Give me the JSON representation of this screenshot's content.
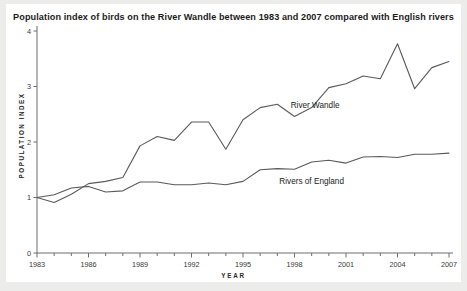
{
  "chart_data": {
    "type": "line",
    "title": "Population index of birds on the River Wandle between 1983 and 2007 compared with English rivers",
    "xlabel": "YEAR",
    "ylabel": "POPULATION INDEX",
    "xlim": [
      1983,
      2007
    ],
    "ylim": [
      0,
      4
    ],
    "yticks": [
      0,
      1,
      2,
      3,
      4
    ],
    "ytick_labels": [
      "0",
      "1",
      "2",
      "3",
      "4"
    ],
    "xticks": [
      1983,
      1984,
      1985,
      1986,
      1987,
      1988,
      1989,
      1990,
      1991,
      1992,
      1993,
      1994,
      1995,
      1996,
      1997,
      1998,
      1999,
      2000,
      2001,
      2002,
      2003,
      2004,
      2005,
      2006,
      2007
    ],
    "xtick_labels": [
      "1983",
      "1986",
      "1989",
      "1992",
      "1995",
      "1998",
      "2001",
      "2004",
      "2007"
    ],
    "labelled_xticks": [
      1983,
      1986,
      1989,
      1992,
      1995,
      1998,
      2001,
      2004,
      2007
    ],
    "grid": false,
    "legend_position": "inline-annotation",
    "x": [
      1983,
      1984,
      1985,
      1986,
      1987,
      1988,
      1989,
      1990,
      1991,
      1992,
      1993,
      1994,
      1995,
      1996,
      1997,
      1998,
      1999,
      2000,
      2001,
      2002,
      2003,
      2004,
      2005,
      2006,
      2007
    ],
    "series": [
      {
        "name": "River Wandle",
        "color": "#5a5a5a",
        "label_x": 1999.2,
        "label_y": 2.62,
        "values": [
          1.0,
          0.91,
          1.06,
          1.25,
          1.29,
          1.36,
          1.93,
          2.1,
          2.03,
          2.36,
          2.36,
          1.87,
          2.4,
          2.62,
          2.68,
          2.46,
          2.62,
          2.98,
          3.05,
          3.19,
          3.14,
          3.77,
          2.96,
          3.34,
          3.45
        ]
      },
      {
        "name": "Rivers of England",
        "color": "#5a5a5a",
        "label_x": 1999.0,
        "label_y": 1.25,
        "values": [
          1.0,
          1.05,
          1.17,
          1.2,
          1.1,
          1.12,
          1.28,
          1.28,
          1.23,
          1.23,
          1.26,
          1.23,
          1.29,
          1.5,
          1.52,
          1.51,
          1.64,
          1.67,
          1.62,
          1.73,
          1.74,
          1.72,
          1.78,
          1.78,
          1.8
        ]
      }
    ]
  }
}
